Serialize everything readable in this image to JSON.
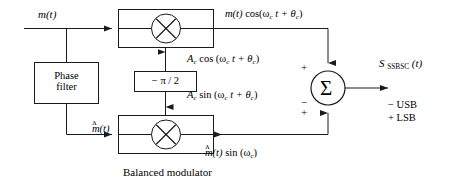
{
  "diagram": {
    "caption": "Balanced modulator",
    "colors": {
      "line": "#1a1a1a",
      "background": "#ffffff",
      "text": "#000000"
    }
  },
  "inputs": {
    "message_signal": "m(t)"
  },
  "blocks": {
    "phase_filter": {
      "line1": "Phase",
      "line2": "filter"
    },
    "phase_shifter": {
      "label": "− π / 2"
    },
    "multiplier_top": {
      "symbol": "×"
    },
    "multiplier_bottom": {
      "symbol": "×"
    },
    "summer": {
      "symbol": "Σ",
      "sign_top": "+",
      "sign_mid": "−",
      "sign_bottom": "+"
    }
  },
  "signals": {
    "top_product": {
      "prefix": "m(t)",
      "func": "cos(ω",
      "sub1": "c",
      "mid": " t + θ",
      "sub2": "c",
      "suffix": ")"
    },
    "carrier_cos": {
      "amp": "A",
      "amp_sub": "c",
      "func": " cos (ω",
      "sub1": "c",
      "mid": " t + θ",
      "sub2": "c",
      "suffix": ")"
    },
    "carrier_sin": {
      "amp": "A",
      "amp_sub": "c",
      "func": " sin (ω",
      "sub1": "c",
      "mid": " t + θ",
      "sub2": "c",
      "suffix": ")"
    },
    "hilbert_signal": {
      "hat": "ʌ",
      "base": "m(t)"
    },
    "bottom_product": {
      "hat": "ʌ",
      "base": "m(t)",
      "func": " sin (ω",
      "sub1": "c",
      "suffix": ")"
    },
    "output": {
      "symbol": "S",
      "sub": "SSBSC",
      "arg": "(t)"
    }
  },
  "annotations": {
    "usb": "− USB",
    "lsb": "+ LSB"
  }
}
